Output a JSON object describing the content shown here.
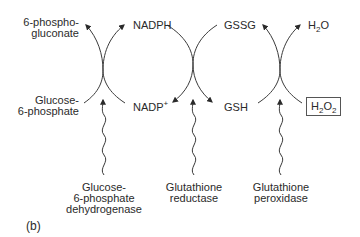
{
  "figure_label": "(b)",
  "colors": {
    "line": "#3a3a3a",
    "text": "#2a2a2a",
    "background": "#ffffff"
  },
  "reactions": [
    {
      "enzyme_lines": [
        "Glucose-",
        "6-phosphate",
        "dehydrogenase"
      ],
      "substrate_lines": [
        "Glucose-",
        "6-phosphate"
      ],
      "product_lines": [
        "6-phospho-",
        "gluconate"
      ]
    },
    {
      "enzyme_lines": [
        "Glutathione",
        "reductase"
      ],
      "cofactor_in": {
        "base": "NADPH"
      },
      "cofactor_out": {
        "base": "NADP",
        "sup": "+"
      },
      "substrate": "GSSG",
      "product": "GSH"
    },
    {
      "enzyme_lines": [
        "Glutathione",
        "peroxidase"
      ],
      "reductant_in": "GSH",
      "oxidized_out": "GSSG",
      "substrate": {
        "a": "H",
        "sub1": "2",
        "b": "O",
        "sub2": "2"
      },
      "product": {
        "a": "H",
        "sub1": "2",
        "b": "O"
      }
    }
  ],
  "labels": {
    "phosphogluconate_1": "6-phospho-",
    "phosphogluconate_2": "gluconate",
    "glucose6p_1": "Glucose-",
    "glucose6p_2": "6-phosphate",
    "nadph": "NADPH",
    "nadp_base": "NADP",
    "nadp_sup": "+",
    "gssg": "GSSG",
    "gsh": "GSH",
    "h2o_a": "H",
    "h2o_sub": "2",
    "h2o_b": "O",
    "h2o2_a": "H",
    "h2o2_sub1": "2",
    "h2o2_b": "O",
    "h2o2_sub2": "2"
  },
  "enzymes": {
    "g6pd": [
      "Glucose-",
      "6-phosphate",
      "dehydrogenase"
    ],
    "gr": [
      "Glutathione",
      "reductase"
    ],
    "gpx": [
      "Glutathione",
      "peroxidase"
    ]
  }
}
